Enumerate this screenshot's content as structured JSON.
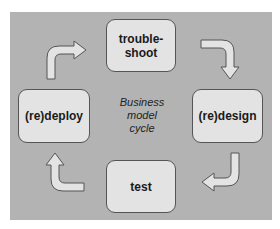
{
  "diagram": {
    "center_label": [
      "Business",
      "model",
      "cycle"
    ],
    "nodes": [
      {
        "id": "troubleshoot",
        "label_line1": "trouble-",
        "label_line2": "shoot"
      },
      {
        "id": "redesign",
        "label": "(re)design"
      },
      {
        "id": "test",
        "label": "test"
      },
      {
        "id": "redeploy",
        "label": "(re)deploy"
      }
    ],
    "edges": [
      {
        "from": "troubleshoot",
        "to": "redesign"
      },
      {
        "from": "redesign",
        "to": "test"
      },
      {
        "from": "test",
        "to": "redeploy"
      },
      {
        "from": "redeploy",
        "to": "troubleshoot"
      }
    ],
    "colors": {
      "background": "#b3b3b3",
      "box_fill": "#e3e3e3",
      "border": "#555555"
    }
  }
}
